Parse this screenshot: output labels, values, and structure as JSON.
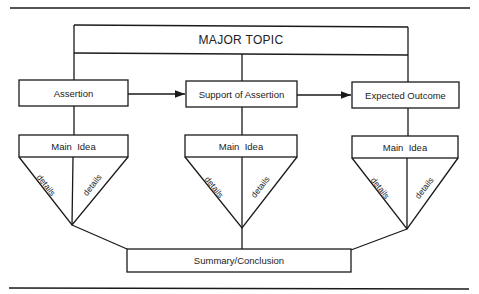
{
  "diagram": {
    "major_topic": "MAJOR TOPIC",
    "flow": [
      {
        "id": "assertion",
        "label": "Assertion"
      },
      {
        "id": "support",
        "label": "Support of Assertion"
      },
      {
        "id": "outcome",
        "label": "Expected Outcome"
      }
    ],
    "main_ideas": [
      {
        "label": "Main  Idea",
        "details_left": "details",
        "details_right": "details"
      },
      {
        "label": "Main  Idea",
        "details_left": "details",
        "details_right": "details"
      },
      {
        "label": "Main  Idea",
        "details_left": "details",
        "details_right": "details"
      }
    ],
    "summary": "Summary/Conclusion",
    "stroke_color": "#1a1a1a"
  }
}
